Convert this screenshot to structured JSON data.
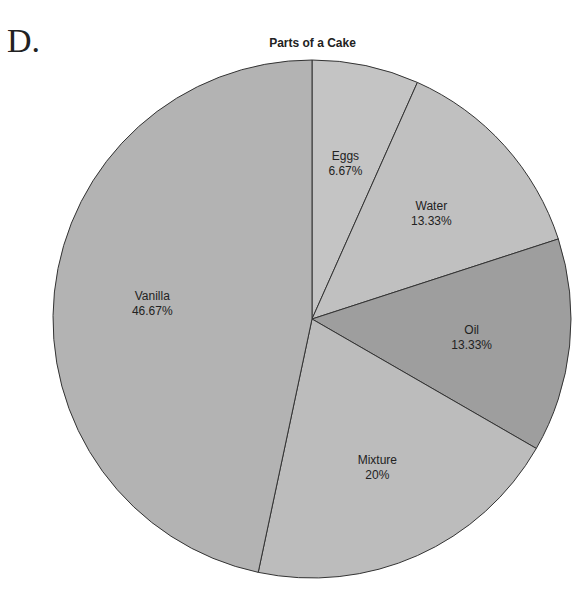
{
  "option_letter": "D.",
  "chart_data": {
    "type": "pie",
    "title": "Parts of a Cake",
    "slices": [
      {
        "label": "Eggs",
        "value": 6.67,
        "display": "6.67%",
        "color": "#c4c4c4"
      },
      {
        "label": "Water",
        "value": 13.33,
        "display": "13.33%",
        "color": "#c0c0c0"
      },
      {
        "label": "Oil",
        "value": 13.33,
        "display": "13.33%",
        "color": "#9e9e9e"
      },
      {
        "label": "Mixture",
        "value": 20,
        "display": "20%",
        "color": "#bcbcbc"
      },
      {
        "label": "Vanilla",
        "value": 46.67,
        "display": "46.67%",
        "color": "#b3b3b3"
      }
    ],
    "start_angle_deg": 0,
    "direction": "clockwise",
    "legend": "none"
  }
}
